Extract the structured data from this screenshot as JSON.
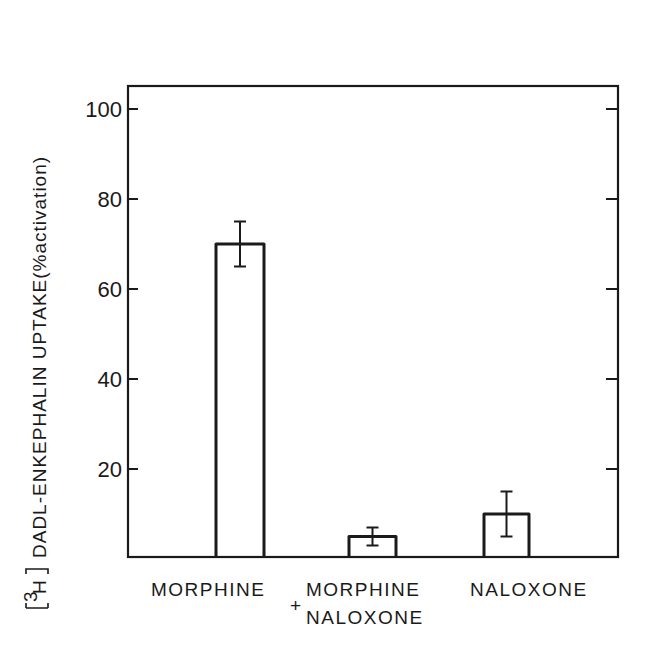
{
  "chart_data": {
    "type": "bar",
    "title": "",
    "xlabel": "",
    "ylabel": "[3H] DADL-ENKEPHALIN UPTAKE(%activation)",
    "ylabel_parts": {
      "bracket_iso": "3H",
      "text": "DADL-ENKEPHALIN UPTAKE(%activation)"
    },
    "categories": [
      "MORPHINE",
      "MORPHINE + NALOXONE",
      "NALOXONE"
    ],
    "category_labels": [
      {
        "line1": "MORPHINE",
        "line2": ""
      },
      {
        "prefix": "+",
        "line1": "MORPHINE",
        "line2": "NALOXONE"
      },
      {
        "line1": "NALOXONE",
        "line2": ""
      }
    ],
    "values": [
      70,
      5,
      10
    ],
    "error_bars": [
      {
        "low": 65,
        "high": 75
      },
      {
        "low": 3,
        "high": 7
      },
      {
        "low": 5,
        "high": 15
      }
    ],
    "ylim": [
      0,
      105
    ],
    "yticks": [
      20,
      40,
      60,
      80,
      100
    ],
    "ytick_labels": [
      "20",
      "40",
      "60",
      "80",
      "100"
    ],
    "grid": false,
    "legend": null,
    "bar_style": "open (unfilled) bars with black outline",
    "mirror_ticks_right": true
  }
}
